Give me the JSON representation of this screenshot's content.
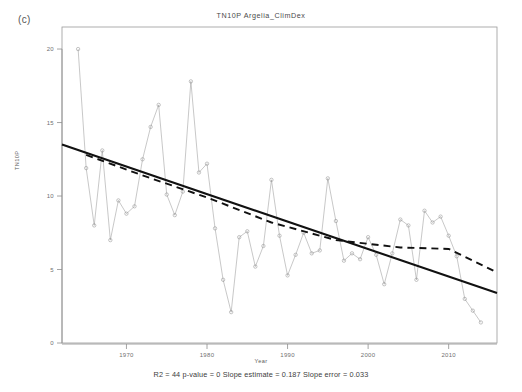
{
  "panel": {
    "label": "(c)"
  },
  "axis_titles": {
    "y": "TN10P",
    "x": "Year"
  },
  "caption": {
    "text": "R2 = 44  p-value = 0  Slope estimate = 0.187  Slope error = 0.033"
  },
  "chart_data": {
    "type": "line",
    "title": "TN10P  Argelia_ClimDex",
    "xlabel": "Year",
    "ylabel": "TN10P",
    "xlim": [
      1962,
      2016
    ],
    "ylim": [
      0,
      21.5
    ],
    "grid": false,
    "legend": "none",
    "xticks": [
      1970,
      1980,
      1990,
      2000,
      2010
    ],
    "xtick_labels": [
      "1970",
      "1980",
      "1990",
      "2000",
      "2010"
    ],
    "yticks": [
      0,
      5,
      10,
      15,
      20
    ],
    "ytick_labels": [
      "0",
      "5",
      "10",
      "15",
      "20"
    ],
    "series": [
      {
        "name": "TN10P annual",
        "style": "line-with-open-circles",
        "color": "#9a9a9a",
        "x": [
          1964,
          1965,
          1966,
          1967,
          1968,
          1969,
          1970,
          1971,
          1972,
          1973,
          1974,
          1975,
          1976,
          1977,
          1978,
          1979,
          1980,
          1981,
          1982,
          1983,
          1984,
          1985,
          1986,
          1987,
          1988,
          1989,
          1990,
          1991,
          1992,
          1993,
          1994,
          1995,
          1996,
          1997,
          1998,
          1999,
          2000,
          2001,
          2002,
          2003,
          2004,
          2005,
          2006,
          2007,
          2008,
          2009,
          2010,
          2011,
          2012,
          2013,
          2014
        ],
        "y": [
          20.0,
          11.9,
          8.0,
          13.1,
          7.0,
          9.7,
          8.8,
          9.3,
          12.5,
          14.7,
          16.2,
          10.1,
          8.7,
          10.3,
          17.8,
          11.6,
          12.2,
          7.8,
          4.3,
          2.1,
          7.2,
          7.6,
          5.2,
          6.6,
          11.1,
          7.3,
          4.6,
          6.0,
          7.5,
          6.1,
          6.3,
          11.2,
          8.3,
          5.6,
          6.1,
          5.7,
          7.2,
          6.0,
          4.0,
          6.1,
          8.4,
          8.0,
          4.3,
          9.0,
          8.2,
          8.6,
          7.3,
          5.9,
          3.0,
          2.2,
          1.4
        ]
      }
    ],
    "trend_lines": [
      {
        "name": "linear-trend",
        "style": "solid",
        "color": "#111111",
        "x": [
          1962,
          2016
        ],
        "y": [
          13.5,
          3.4
        ]
      },
      {
        "name": "loess-trend",
        "style": "dashed",
        "color": "#111111",
        "x": [
          1965,
          1972,
          1980,
          1988,
          1996,
          2004,
          2010,
          2016
        ],
        "y": [
          12.8,
          11.4,
          9.9,
          8.2,
          7.0,
          6.5,
          6.4,
          4.8
        ]
      }
    ]
  }
}
